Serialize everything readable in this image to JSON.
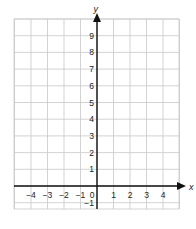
{
  "chart_data": {
    "type": "scatter",
    "title": "",
    "xlabel": "x",
    "ylabel": "y",
    "xlim": [
      -5,
      5
    ],
    "ylim": [
      -2,
      10
    ],
    "grid": true,
    "x_ticks": [
      "-4",
      "-3",
      "-2",
      "-1",
      "0",
      "1",
      "2",
      "3",
      "4"
    ],
    "y_ticks": [
      "-1",
      "1",
      "2",
      "3",
      "4",
      "5",
      "6",
      "7",
      "8",
      "9"
    ],
    "series": [],
    "colors": {
      "grid": "#c8c8c8",
      "axis": "#111111"
    }
  },
  "axes": {
    "x_label": "x",
    "y_label": "y"
  }
}
